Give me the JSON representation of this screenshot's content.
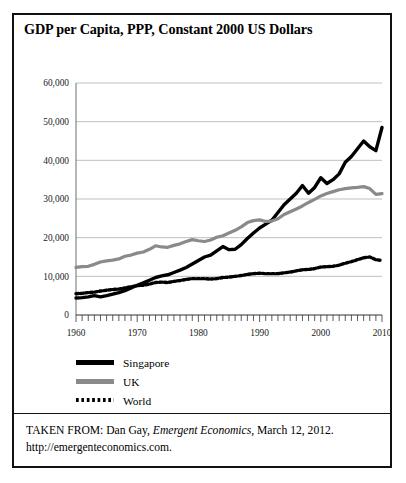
{
  "figure": {
    "title": "GDP per Capita, PPP, Constant 2000 US Dollars"
  },
  "source": {
    "prefix": "TAKEN FROM: Dan Gay,",
    "publication": "Emergent Economics",
    "suffix": ", March 12, 2012.",
    "url": "http://emergenteconomics.com."
  },
  "colors": {
    "singapore": "#000000",
    "uk": "#8a8a8a",
    "world": "#000000",
    "gridline": "#b8b8b8",
    "axis": "#6e6e6e",
    "border": "#111111"
  },
  "chart_data": {
    "type": "line",
    "title": "GDP per Capita, PPP, Constant 2000 US Dollars",
    "xlabel": "",
    "ylabel": "",
    "xlim": [
      1960,
      2010
    ],
    "ylim": [
      0,
      60000
    ],
    "yticks": [
      0,
      10000,
      20000,
      30000,
      40000,
      50000,
      60000
    ],
    "ytick_labels": [
      "0",
      "10,000",
      "20,000",
      "30,000",
      "40,000",
      "50,000",
      "60,000"
    ],
    "xticks": [
      1960,
      1970,
      1980,
      1990,
      2000,
      2010
    ],
    "xtick_labels": [
      "1960",
      "1970",
      "1980",
      "1990",
      "2000",
      "2010"
    ],
    "minor_xtick_interval": 1,
    "grid": "horizontal",
    "legend_position": "below-left",
    "x": [
      1960,
      1961,
      1962,
      1963,
      1964,
      1965,
      1966,
      1967,
      1968,
      1969,
      1970,
      1971,
      1972,
      1973,
      1974,
      1975,
      1976,
      1977,
      1978,
      1979,
      1980,
      1981,
      1982,
      1983,
      1984,
      1985,
      1986,
      1987,
      1988,
      1989,
      1990,
      1991,
      1992,
      1993,
      1994,
      1995,
      1996,
      1997,
      1998,
      1999,
      2000,
      2001,
      2002,
      2003,
      2004,
      2005,
      2006,
      2007,
      2008,
      2009,
      2010
    ],
    "series": [
      {
        "name": "Singapore",
        "style": "solid-thick",
        "color": "#000000",
        "values": [
          4400,
          4500,
          4700,
          5000,
          4700,
          5000,
          5400,
          5800,
          6300,
          7000,
          7700,
          8300,
          9000,
          9700,
          10100,
          10400,
          11000,
          11600,
          12300,
          13200,
          14100,
          15000,
          15500,
          16600,
          17700,
          16900,
          17000,
          18200,
          19800,
          21200,
          22500,
          23500,
          24500,
          26500,
          28500,
          30000,
          31500,
          33500,
          31500,
          33000,
          35500,
          34000,
          35000,
          36500,
          39500,
          41000,
          43000,
          45000,
          43500,
          42500,
          48500
        ]
      },
      {
        "name": "UK",
        "style": "solid-medium",
        "color": "#8a8a8a",
        "values": [
          12300,
          12500,
          12600,
          13100,
          13700,
          14000,
          14200,
          14500,
          15200,
          15500,
          16000,
          16300,
          17000,
          17900,
          17600,
          17500,
          18000,
          18400,
          19000,
          19500,
          19200,
          19000,
          19400,
          20100,
          20500,
          21200,
          21900,
          22800,
          23900,
          24400,
          24600,
          24200,
          24300,
          24900,
          26000,
          26700,
          27400,
          28200,
          29100,
          29900,
          30800,
          31400,
          31900,
          32400,
          32700,
          32900,
          33000,
          33200,
          32700,
          31200,
          31400
        ]
      },
      {
        "name": "World",
        "style": "dotted",
        "color": "#000000",
        "values": [
          5500,
          5600,
          5800,
          5900,
          6200,
          6400,
          6600,
          6700,
          7000,
          7300,
          7600,
          7700,
          8000,
          8400,
          8500,
          8400,
          8700,
          8900,
          9200,
          9400,
          9400,
          9400,
          9300,
          9400,
          9700,
          9800,
          10000,
          10200,
          10500,
          10700,
          10800,
          10700,
          10700,
          10700,
          10900,
          11100,
          11400,
          11700,
          11800,
          12000,
          12400,
          12500,
          12600,
          12900,
          13400,
          13800,
          14300,
          14800,
          15000,
          14300,
          14100
        ]
      }
    ]
  }
}
